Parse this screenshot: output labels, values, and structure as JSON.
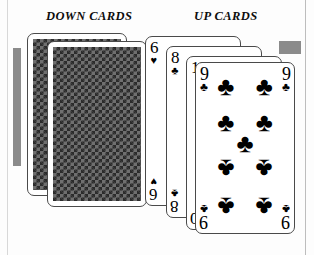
{
  "figure": {
    "type": "playing-card-illustration",
    "headings": {
      "down": "DOWN CARDS",
      "up": "UP CARDS"
    }
  },
  "colors": {
    "card_face": "#ffffff",
    "card_border": "#4a4a4a",
    "ink": "#000000",
    "shadow_gray": "#8b8b8b",
    "back_pattern_dark": "#2b2b2b",
    "back_pattern_light": "#6f6f6f",
    "page_background": "#fdfdfd"
  },
  "down_cards": [
    {
      "id": "down-back-1",
      "face": "down",
      "back_pattern": "diagonal-lattice"
    },
    {
      "id": "down-back-2",
      "face": "down",
      "back_pattern": "diagonal-lattice"
    }
  ],
  "up_cards": [
    {
      "id": "up-1",
      "rank": "6",
      "suit": "♥",
      "suit_name": "hearts",
      "label": "6 of hearts"
    },
    {
      "id": "up-2",
      "rank": "8",
      "suit": "♣",
      "suit_name": "clubs",
      "label": "8 of clubs"
    },
    {
      "id": "up-3",
      "rank": "10",
      "suit": "♦",
      "suit_name": "diamonds",
      "label": "10 of diamonds"
    },
    {
      "id": "up-4",
      "rank": "9",
      "suit": "♣",
      "suit_name": "clubs",
      "label": "9 of clubs"
    }
  ],
  "front_card": {
    "rank": "9",
    "suit": "♣",
    "pip_count": 9,
    "pip_glyph": "♣"
  }
}
